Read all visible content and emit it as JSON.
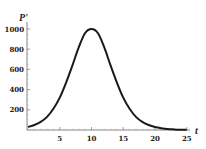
{
  "chart_data": {
    "type": "line",
    "title": "",
    "xlabel": "t",
    "ylabel": "P'",
    "xlim": [
      0,
      25
    ],
    "ylim": [
      0,
      1050
    ],
    "x_ticks": [
      "5",
      "10",
      "15",
      "20",
      "25"
    ],
    "y_ticks": [
      "200",
      "400",
      "600",
      "800",
      "1000"
    ],
    "grid": false,
    "legend": null,
    "series": [
      {
        "name": "P'",
        "x": [
          0,
          1,
          2,
          3,
          4,
          5,
          6,
          7,
          8,
          9,
          10,
          11,
          12,
          13,
          14,
          15,
          16,
          17,
          18,
          19,
          20,
          21,
          22,
          23,
          24,
          25
        ],
        "values": [
          30,
          50,
          80,
          130,
          210,
          320,
          470,
          640,
          820,
          960,
          1000,
          960,
          820,
          640,
          470,
          320,
          210,
          130,
          80,
          50,
          30,
          18,
          10,
          6,
          3,
          2
        ]
      }
    ],
    "colors": {
      "curve": "#1a1a1a",
      "axis": "#555555"
    }
  }
}
